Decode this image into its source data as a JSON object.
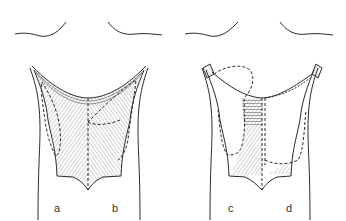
{
  "figure": {
    "panels": [
      {
        "id": "left-torso",
        "labels": [
          "a",
          "b"
        ]
      },
      {
        "id": "right-torso",
        "labels": [
          "c",
          "d"
        ]
      }
    ],
    "labels": {
      "a": "a",
      "b": "b",
      "c": "c",
      "d": "d"
    },
    "colors": {
      "line": "#2a2a2a",
      "hatch": "#555555",
      "background": "#ffffff"
    }
  }
}
